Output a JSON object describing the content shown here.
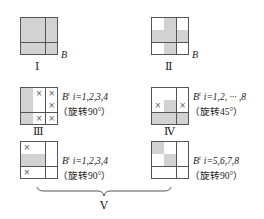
{
  "figure": {
    "panels": [
      {
        "id": "I",
        "roman": "Ⅰ",
        "label": "B",
        "superscript": "",
        "index_text": "",
        "rotation_text": "",
        "cells": [
          [
            "g",
            "g",
            "g"
          ],
          [
            "g",
            "g",
            "g"
          ],
          [
            "g",
            "g",
            "g"
          ]
        ]
      },
      {
        "id": "II",
        "roman": "Ⅱ",
        "label": "B",
        "superscript": "",
        "index_text": "",
        "rotation_text": "",
        "cells": [
          [
            "w",
            "g",
            "w"
          ],
          [
            "g",
            "g",
            "g"
          ],
          [
            "w",
            "g",
            "w"
          ]
        ]
      },
      {
        "id": "III",
        "roman": "Ⅲ",
        "label": "B",
        "superscript": "i",
        "index_text": "i=1,2,3,4",
        "rotation_text": "（旋转90°）",
        "cells": [
          [
            "g",
            "x",
            "x"
          ],
          [
            "g",
            "w",
            "x"
          ],
          [
            "g",
            "x",
            "x"
          ]
        ]
      },
      {
        "id": "IV",
        "roman": "Ⅳ",
        "label": "B",
        "superscript": "i",
        "index_text": "i=1,2, ··· ,8",
        "rotation_text": "（旋转45°）",
        "cells": [
          [
            "w",
            "w",
            "w"
          ],
          [
            "x",
            "g",
            "x"
          ],
          [
            "g",
            "g",
            "g"
          ]
        ]
      },
      {
        "id": "V-a",
        "roman": "",
        "label": "B",
        "superscript": "i",
        "index_text": "i=1,2,3,4",
        "rotation_text": "（旋转90°）",
        "cells": [
          [
            "x",
            "w",
            "w"
          ],
          [
            "g",
            "g",
            "w"
          ],
          [
            "x",
            "w",
            "w"
          ]
        ]
      },
      {
        "id": "V-b",
        "roman": "",
        "label": "B",
        "superscript": "i",
        "index_text": "i=5,6,7,8",
        "rotation_text": "（旋转90°）",
        "cells": [
          [
            "g",
            "w",
            "w"
          ],
          [
            "w",
            "g",
            "w"
          ],
          [
            "w",
            "w",
            "w"
          ]
        ]
      }
    ],
    "group_label": "Ⅴ",
    "legend": {
      "g": "shaded cell",
      "w": "white cell",
      "x": "cell marked ×"
    },
    "colors": {
      "shade": "#d2d2d2",
      "line": "#555555"
    }
  }
}
